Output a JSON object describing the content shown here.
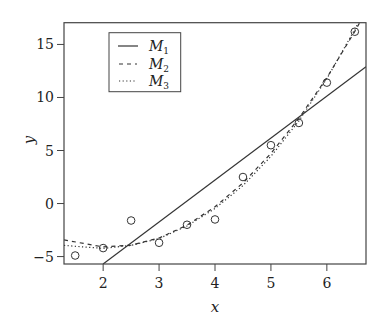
{
  "chart_data": {
    "type": "scatter",
    "title": "",
    "xlabel": "x",
    "ylabel": "y",
    "xlim": [
      1.3,
      6.7
    ],
    "ylim": [
      -5.7,
      17.05
    ],
    "xticks": [
      2,
      3,
      4,
      5,
      6
    ],
    "yticks": [
      -5,
      0,
      5,
      10,
      15
    ],
    "xtick_labels": [
      "2",
      "3",
      "4",
      "5",
      "6"
    ],
    "ytick_labels": [
      "−5",
      "0",
      "5",
      "10",
      "15"
    ],
    "grid": false,
    "legend_position": "upper left",
    "points": {
      "marker": "open-circle",
      "x": [
        1.5,
        2.0,
        2.5,
        3.0,
        3.5,
        4.0,
        4.5,
        5.0,
        5.5,
        6.0,
        6.5
      ],
      "y": [
        -4.9,
        -4.2,
        -1.6,
        -3.7,
        -2.0,
        -1.5,
        2.5,
        5.5,
        7.6,
        11.4,
        16.2
      ]
    },
    "series": [
      {
        "name": "M1",
        "sub": "1",
        "style": "solid",
        "model": "linear",
        "x": [
          2.0,
          6.7
        ],
        "y": [
          -5.7,
          12.9
        ]
      },
      {
        "name": "M2",
        "sub": "2",
        "style": "dashed",
        "model": "quadratic",
        "x": [
          1.3,
          2.0,
          2.5,
          3.0,
          3.5,
          4.0,
          4.5,
          5.0,
          5.5,
          6.0,
          6.5,
          6.7
        ],
        "y": [
          -3.43,
          -4.09,
          -3.93,
          -3.25,
          -2.04,
          -0.31,
          1.95,
          4.73,
          8.04,
          11.87,
          16.23,
          18.12
        ]
      },
      {
        "name": "M3",
        "sub": "3",
        "style": "dotted",
        "model": "cubic",
        "x": [
          1.3,
          2.0,
          2.5,
          3.0,
          3.5,
          4.0,
          4.5,
          5.0,
          5.5,
          6.0,
          6.5,
          6.7
        ],
        "y": [
          -3.95,
          -4.23,
          -3.95,
          -3.3,
          -2.12,
          -0.47,
          1.69,
          4.44,
          7.79,
          11.78,
          16.42,
          18.48
        ]
      }
    ]
  },
  "legend": {
    "items": [
      {
        "label": "M",
        "sub": "1"
      },
      {
        "label": "M",
        "sub": "2"
      },
      {
        "label": "M",
        "sub": "3"
      }
    ]
  },
  "axes": {
    "xlabel": "x",
    "ylabel": "y"
  }
}
